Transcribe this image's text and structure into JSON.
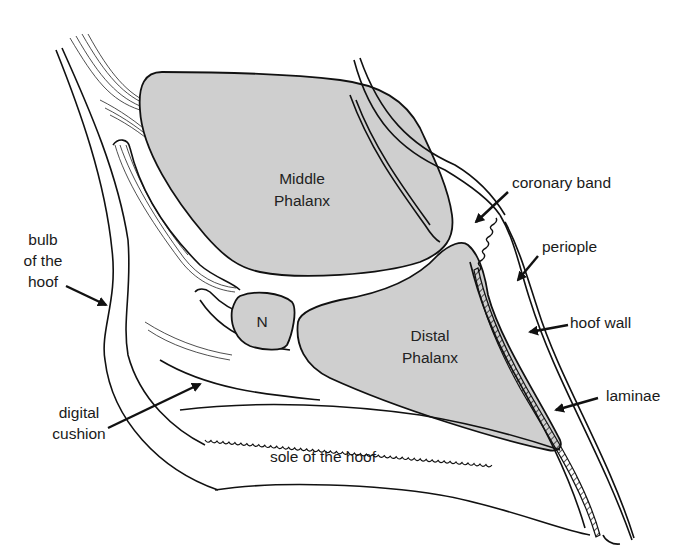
{
  "colors": {
    "bone_fill": "#cfcfcf",
    "line": "#111111",
    "background": "#ffffff"
  },
  "bones": {
    "middle_phalanx": {
      "line1": "Middle",
      "line2": "Phalanx"
    },
    "distal_phalanx": {
      "line1": "Distal",
      "line2": "Phalanx"
    },
    "navicular": {
      "label": "N"
    }
  },
  "labels": {
    "bulb": {
      "line1": "bulb",
      "line2": "of the",
      "line3": "hoof"
    },
    "digital_cushion": {
      "line1": "digital",
      "line2": "cushion"
    },
    "sole": "sole of the hoof",
    "coronary_band": "coronary band",
    "periople": "periople",
    "hoof_wall": "hoof wall",
    "laminae": "laminae"
  }
}
